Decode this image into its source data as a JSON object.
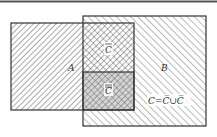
{
  "diagram": {
    "labels": {
      "A": "A",
      "B": "B",
      "cbar_top": "C",
      "cbar_bottom": "C",
      "equation": "C=C̅∪C̅"
    },
    "colors": {
      "stroke": "#333333",
      "hatch": "#555555",
      "background": "#ffffff"
    }
  }
}
